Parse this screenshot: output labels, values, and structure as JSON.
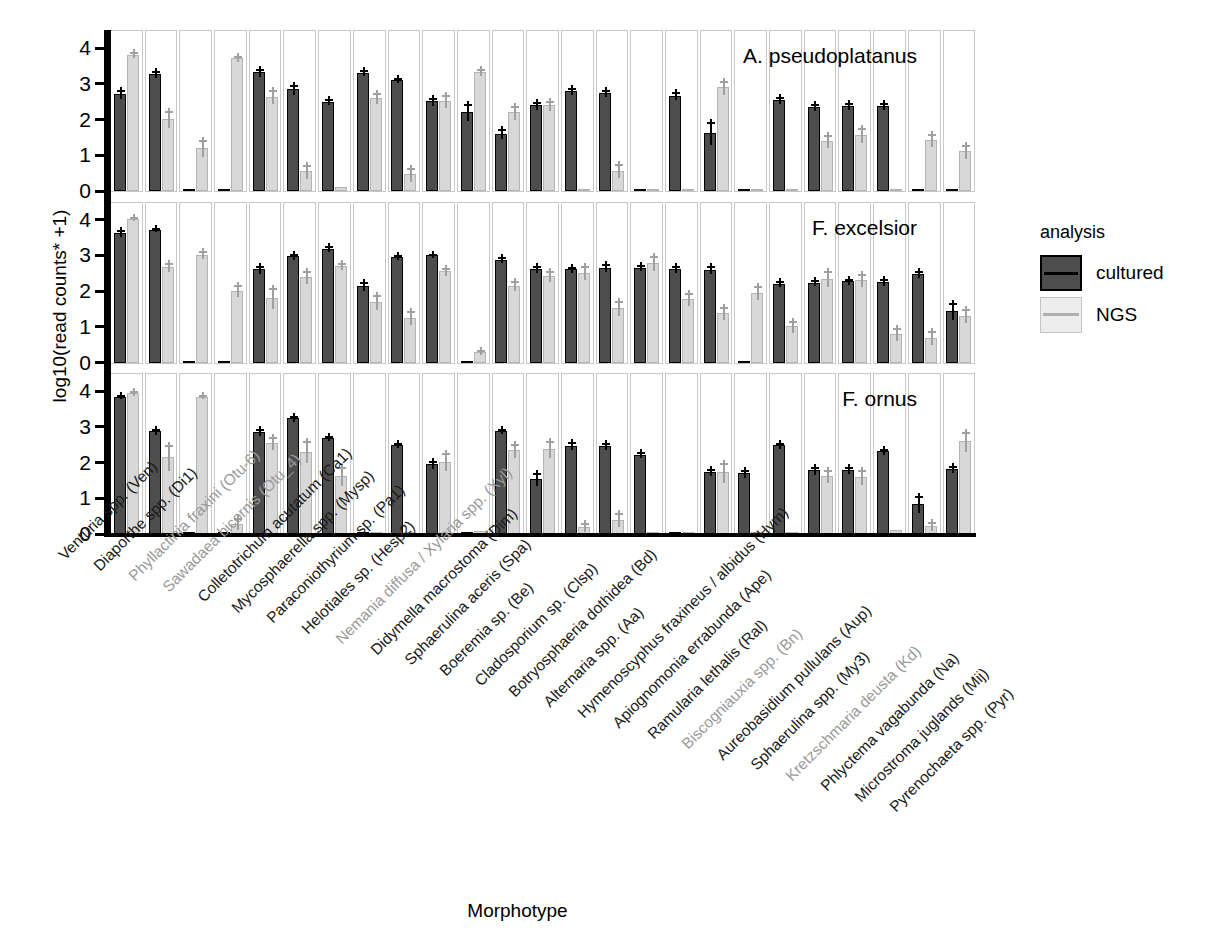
{
  "figure": {
    "y_axis_label": "log10(read counts* +1)",
    "x_axis_label": "Morphotype"
  },
  "legend": {
    "title": "analysis",
    "items": [
      {
        "label": "cultured",
        "color": "#4d4d4d"
      },
      {
        "label": "NGS",
        "color": "#ededed"
      }
    ]
  },
  "chart_data": {
    "type": "bar",
    "title": "",
    "subtitle": "",
    "xlabel": "Morphotype",
    "ylabel": "log10(read counts* +1)",
    "ylim": [
      0,
      4.2
    ],
    "yticks": [
      0,
      1,
      2,
      3,
      4
    ],
    "grid": false,
    "legend_position": "right",
    "facet_variable": "host tree species",
    "facets": [
      "A. pseudoplatanus",
      "F. excelsior",
      "F. ornus"
    ],
    "series_names": [
      "cultured",
      "NGS"
    ],
    "categories": [
      "Venturia spp. (Ven)",
      "Diaporthe spp. (Di1)",
      "Phyllactinia fraxini (Otu-6)",
      "Sawadaea bicornis (Otu_4)",
      "Colletotrichum acutatum (Ca1)",
      "Mycosphaerella spp. (Mysp)",
      "Paraconiothyrium sp. (Pa1)",
      "Helotiales sp. (Hesp2)",
      "Nemania diffusa / Xylaria spp. (Xyl)",
      "Didymella macrostoma (Dim)",
      "Sphaerulina aceris (Spa)",
      "Boeremia sp. (Be)",
      "Cladosporium sp. (Clsp)",
      "Botryosphaeria dothidea (Bd)",
      "Alternaria spp. (Aa)",
      "Hymenoscyphus fraxineus / albidus (Hym)",
      "Apiognomonia errabunda (Ape)",
      "Ramularia lethalis (Ral)",
      "Biscogniauxia spp. (Bn)",
      "Aureobasidium pullulans (Aup)",
      "Sphaerulina spp. (My3)",
      "Kretzschmaria deusta (Kd)",
      "Phlyctema vagabunda (Na)",
      "Microstroma juglands (Mij)",
      "Pyrenochaeta spp. (Pyr)"
    ],
    "category_label_styles": [
      "black",
      "black",
      "grey",
      "grey",
      "black",
      "black",
      "black",
      "black",
      "grey",
      "black",
      "black",
      "black",
      "black",
      "black",
      "black",
      "black",
      "black",
      "black",
      "grey",
      "black",
      "black",
      "grey",
      "black",
      "black",
      "black"
    ],
    "panels": [
      {
        "name": "A. pseudoplatanus",
        "series": [
          {
            "name": "cultured",
            "values": [
              2.72,
              3.27,
              0.03,
              0.04,
              3.32,
              2.85,
              2.5,
              3.31,
              3.1,
              2.51,
              2.21,
              1.61,
              2.4,
              2.8,
              2.74,
              0.04,
              2.67,
              1.62,
              0.03,
              2.54,
              2.36,
              2.38,
              2.38,
              0.03,
              0.03
            ],
            "errors": [
              0.12,
              0.08,
              0.02,
              0.02,
              0.09,
              0.12,
              0.07,
              0.07,
              0.06,
              0.09,
              0.22,
              0.13,
              0.09,
              0.08,
              0.09,
              0.02,
              0.1,
              0.3,
              0.02,
              0.08,
              0.09,
              0.09,
              0.08,
              0.02,
              0.02
            ]
          },
          {
            "name": "NGS",
            "values": [
              3.82,
              2.01,
              1.2,
              3.72,
              2.64,
              0.55,
              0.1,
              2.6,
              0.47,
              2.52,
              3.34,
              2.2,
              2.4,
              0.03,
              0.57,
              0.06,
              0.04,
              2.9,
              0.06,
              0.03,
              1.41,
              1.57,
              0.03,
              1.43,
              1.11
            ],
            "errors": [
              0.06,
              0.23,
              0.22,
              0.07,
              0.18,
              0.18,
              0.07,
              0.14,
              0.18,
              0.17,
              0.09,
              0.17,
              0.12,
              0.02,
              0.18,
              0.04,
              0.03,
              0.17,
              0.05,
              0.02,
              0.17,
              0.2,
              0.02,
              0.18,
              0.19
            ]
          }
        ]
      },
      {
        "name": "F. excelsior",
        "series": [
          {
            "name": "cultured",
            "values": [
              3.62,
              3.72,
              0.03,
              0.03,
              2.61,
              2.97,
              3.19,
              2.15,
              2.96,
              3.0,
              0.02,
              2.88,
              2.62,
              2.61,
              2.66,
              2.66,
              2.62,
              2.6,
              0.03,
              2.21,
              2.24,
              2.27,
              2.26,
              2.48,
              1.45
            ],
            "errors": [
              0.09,
              0.05,
              0.02,
              0.02,
              0.09,
              0.07,
              0.06,
              0.11,
              0.06,
              0.05,
              0.02,
              0.07,
              0.08,
              0.07,
              0.09,
              0.06,
              0.08,
              0.1,
              0.02,
              0.07,
              0.06,
              0.07,
              0.09,
              0.09,
              0.22
            ]
          },
          {
            "name": "NGS",
            "values": [
              4.03,
              2.67,
              3.02,
              2.01,
              1.81,
              2.39,
              2.7,
              1.7,
              1.25,
              2.55,
              0.29,
              2.15,
              2.42,
              2.52,
              1.52,
              2.78,
              1.79,
              1.39,
              1.96,
              1.01,
              2.35,
              2.3,
              0.8,
              0.7,
              1.31
            ],
            "errors": [
              0.05,
              0.12,
              0.1,
              0.15,
              0.28,
              0.16,
              0.09,
              0.2,
              0.18,
              0.11,
              0.06,
              0.13,
              0.15,
              0.19,
              0.2,
              0.19,
              0.17,
              0.16,
              0.18,
              0.16,
              0.2,
              0.17,
              0.16,
              0.18,
              0.18
            ]
          }
        ]
      },
      {
        "name": "F. ornus",
        "series": [
          {
            "name": "cultured",
            "values": [
              3.85,
              2.88,
              0.03,
              0.04,
              2.85,
              3.24,
              2.69,
              0.03,
              2.49,
              1.95,
              0.04,
              2.88,
              1.54,
              2.47,
              2.47,
              2.22,
              0.03,
              1.73,
              1.7,
              2.49,
              1.78,
              1.8,
              2.32,
              0.85,
              1.82
            ],
            "errors": [
              0.05,
              0.07,
              0.02,
              0.02,
              0.09,
              0.07,
              0.06,
              0.02,
              0.05,
              0.09,
              0.02,
              0.06,
              0.18,
              0.1,
              0.08,
              0.07,
              0.02,
              0.09,
              0.09,
              0.07,
              0.09,
              0.08,
              0.07,
              0.22,
              0.09
            ]
          },
          {
            "name": "NGS",
            "values": [
              3.94,
              2.15,
              3.85,
              0.29,
              2.55,
              2.31,
              1.63,
              0.05,
              0.03,
              2.03,
              0.08,
              2.34,
              2.39,
              0.2,
              0.4,
              0.03,
              0.03,
              1.73,
              0.04,
              0.03,
              1.63,
              1.6,
              0.12,
              0.22,
              2.6
            ],
            "errors": [
              0.06,
              0.35,
              0.05,
              0.15,
              0.16,
              0.3,
              0.25,
              0.05,
              0.02,
              0.24,
              0.05,
              0.17,
              0.22,
              0.12,
              0.18,
              0.02,
              0.02,
              0.27,
              0.03,
              0.02,
              0.17,
              0.19,
              0.07,
              0.12,
              0.27
            ]
          }
        ]
      }
    ]
  }
}
